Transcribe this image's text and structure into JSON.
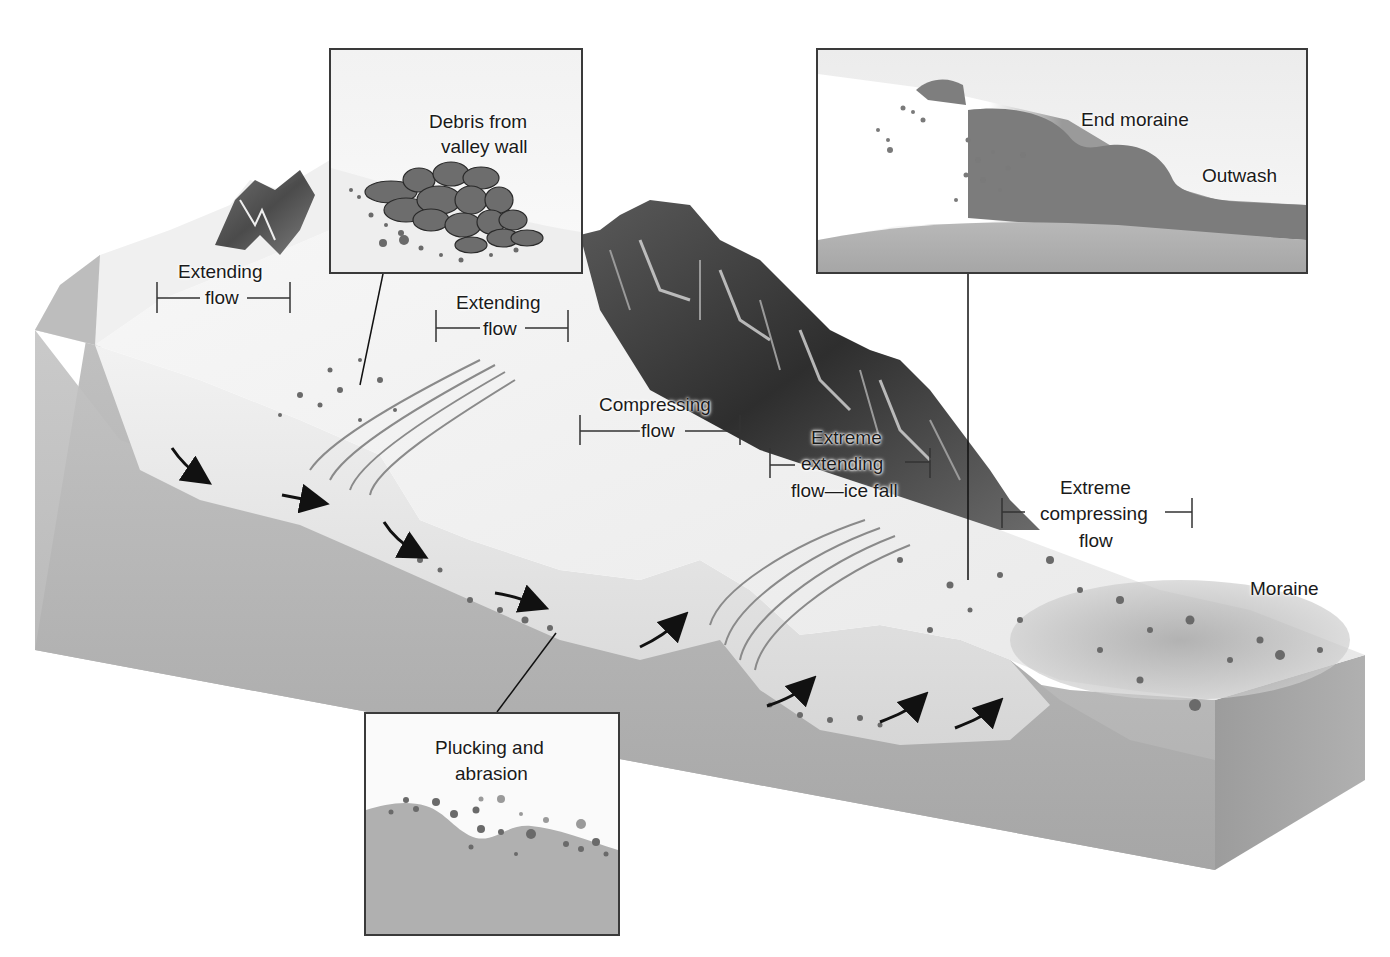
{
  "diagram": {
    "colors": {
      "background": "#ffffff",
      "bedrock": "#b4b4b4",
      "bedrock_dark": "#9a9a9a",
      "ice": "#ededed",
      "ice_shadow": "#d2d2d2",
      "mountain_dark": "#3c3c3c",
      "moraine": "#8a8a8a",
      "boulder": "#6a6a6a",
      "line": "#1a1a1a"
    },
    "labels": {
      "extending_flow_1": {
        "line1": "Extending",
        "line2": "flow"
      },
      "extending_flow_2": {
        "line1": "Extending",
        "line2": "flow"
      },
      "compressing_flow": {
        "line1": "Compressing",
        "line2": "flow"
      },
      "extreme_extending_flow": {
        "line1": "Extreme",
        "line2": "extending",
        "line3": "flow—ice fall"
      },
      "extreme_compressing_flow": {
        "line1": "Extreme",
        "line2": "compressing",
        "line3": "flow"
      },
      "moraine": "Moraine"
    },
    "insets": {
      "debris": {
        "line1": "Debris from",
        "line2": "valley wall"
      },
      "end_moraine": {
        "end_moraine": "End moraine",
        "outwash": "Outwash"
      },
      "plucking": {
        "line1": "Plucking and",
        "line2": "abrasion"
      }
    }
  }
}
